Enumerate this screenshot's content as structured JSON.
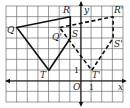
{
  "diagram": {
    "type": "coordinate-plane-translation",
    "grid": {
      "cols": 11,
      "rows": 9,
      "unit_px": 10.7,
      "origin_px": [
        81,
        81
      ],
      "left_px": 6,
      "top_px": 6,
      "right_px": 123,
      "bottom_px": 102
    },
    "axes": {
      "x_label": "x",
      "y_label": "y",
      "origin_label": "O",
      "x_tick_label": "1",
      "y_tick_label": "1"
    },
    "original_figure": {
      "style": "solid",
      "vertices": [
        {
          "name": "Q",
          "label": "Q",
          "x": -6,
          "y": 5
        },
        {
          "name": "R",
          "label": "R",
          "x": -1,
          "y": 6
        },
        {
          "name": "S",
          "label": "S",
          "x": -1,
          "y": 4
        },
        {
          "name": "T",
          "label": "T",
          "x": -3,
          "y": 1
        }
      ]
    },
    "image_figure": {
      "style": "dashed",
      "vertices": [
        {
          "name": "Q'",
          "label": "Q'",
          "x": -2,
          "y": 5
        },
        {
          "name": "R'",
          "label": "R'",
          "x": 3,
          "y": 6
        },
        {
          "name": "S'",
          "label": "S'",
          "x": 3,
          "y": 4
        },
        {
          "name": "T'",
          "label": "T'",
          "x": 1,
          "y": 1
        }
      ]
    },
    "colors": {
      "grid": "#555555",
      "lines": "#111111",
      "background": "#ffffff"
    }
  }
}
